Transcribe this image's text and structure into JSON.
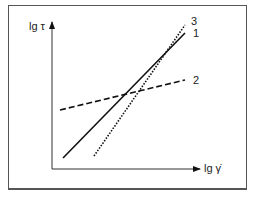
{
  "diagram": {
    "type": "flow-curves-log-log",
    "y_axis_label": "lg τ",
    "x_axis_label": "lg γ̇",
    "curves": [
      {
        "id": "1",
        "label": "1",
        "style": "solid",
        "description": "Newtonian"
      },
      {
        "id": "2",
        "label": "2",
        "style": "dashed",
        "description": "shear-thinning (pseudoplastic)"
      },
      {
        "id": "3",
        "label": "3",
        "style": "dotted",
        "description": "shear-thickening (dilatant)"
      }
    ]
  },
  "colors": {
    "line": "#111111",
    "frame": "#555555",
    "background": "#ffffff"
  }
}
